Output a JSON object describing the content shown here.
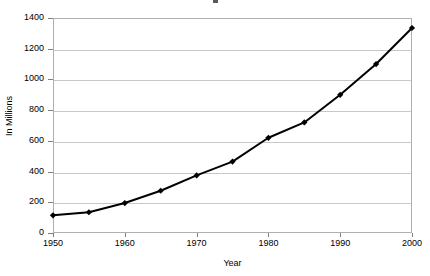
{
  "chart_data": {
    "type": "line",
    "title": "",
    "xlabel": "Year",
    "ylabel": "In Millions",
    "x": [
      1950,
      1955,
      1960,
      1965,
      1970,
      1975,
      1980,
      1985,
      1990,
      1995,
      2000
    ],
    "values": [
      115,
      135,
      195,
      275,
      375,
      465,
      620,
      720,
      900,
      1100,
      1335
    ],
    "series": [
      {
        "name": "In Millions",
        "values": [
          115,
          135,
          195,
          275,
          375,
          465,
          620,
          720,
          900,
          1100,
          1335
        ]
      }
    ],
    "xlim": [
      1950,
      2000
    ],
    "ylim": [
      0,
      1400
    ],
    "x_tick_labels": [
      "1950",
      "1960",
      "1970",
      "1980",
      "1990",
      "2000"
    ],
    "x_tick_values": [
      1950,
      1960,
      1970,
      1980,
      1990,
      2000
    ],
    "y_tick_labels": [
      "0",
      "200",
      "400",
      "600",
      "800",
      "1000",
      "1200",
      "1400"
    ],
    "y_tick_values": [
      0,
      200,
      400,
      600,
      800,
      1000,
      1200,
      1400
    ],
    "grid": "horizontal",
    "legend": "none",
    "marker": "filled-diamond",
    "line_color": "#000000",
    "marker_color": "#000000",
    "grid_color": "#c8c8c8",
    "frame_color": "#b0b0b0",
    "background": "#ffffff"
  }
}
